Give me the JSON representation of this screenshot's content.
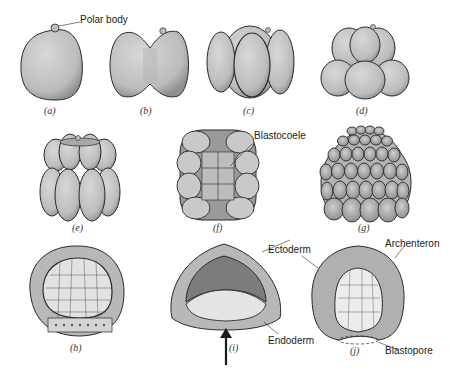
{
  "figure": {
    "panels": [
      {
        "id": "a",
        "caption": "(a)"
      },
      {
        "id": "b",
        "caption": "(b)"
      },
      {
        "id": "c",
        "caption": "(c)"
      },
      {
        "id": "d",
        "caption": "(d)"
      },
      {
        "id": "e",
        "caption": "(e)"
      },
      {
        "id": "f",
        "caption": "(f)"
      },
      {
        "id": "g",
        "caption": "(g)"
      },
      {
        "id": "h",
        "caption": "(h)"
      },
      {
        "id": "i",
        "caption": "(i)"
      },
      {
        "id": "j",
        "caption": "(j)"
      }
    ],
    "labels": {
      "polar_body": "Polar body",
      "blastocoele": "Blastocoele",
      "ectoderm": "Ectoderm",
      "endoderm": "Endoderm",
      "archenteron": "Archenteron",
      "blastopore": "Blastopore"
    },
    "colors": {
      "cell_fill": "#c8c8c8",
      "cell_stroke": "#2a2a2a",
      "light_fill": "#e6e6e6",
      "dark_fill": "#9a9a9a"
    }
  }
}
